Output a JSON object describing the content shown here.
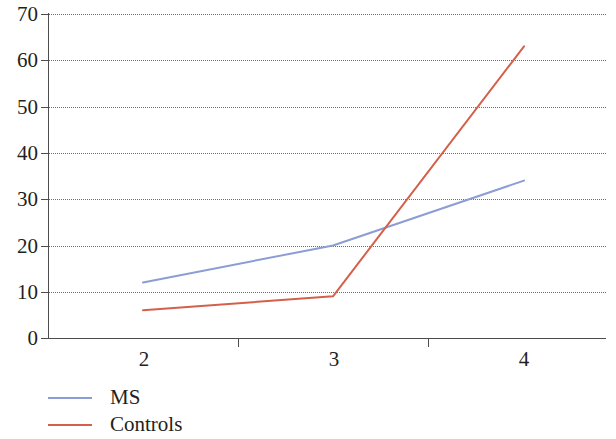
{
  "chart_data": {
    "type": "line",
    "title": "",
    "subtitle": "",
    "xlabel": "",
    "ylabel": "",
    "x": [
      2,
      3,
      4
    ],
    "x_tick_labels": [
      "2",
      "3",
      "4"
    ],
    "y_tick_labels": [
      "0",
      "10",
      "20",
      "30",
      "40",
      "50",
      "60",
      "70"
    ],
    "y_ticks": [
      0,
      10,
      20,
      30,
      40,
      50,
      60,
      70
    ],
    "xlim": [
      1.5,
      4.5
    ],
    "ylim": [
      0,
      70
    ],
    "grid": "horizontal-dotted",
    "legend_position": "bottom-left",
    "series": [
      {
        "name": "MS",
        "color": "#8b9dd4",
        "values": [
          12,
          20,
          34
        ]
      },
      {
        "name": "Controls",
        "color": "#d4604a",
        "values": [
          6,
          9,
          63
        ]
      }
    ]
  },
  "legend": {
    "items": [
      {
        "label": "MS",
        "color": "#8b9dd4"
      },
      {
        "label": "Controls",
        "color": "#d4604a"
      }
    ]
  },
  "colors": {
    "axis": "#4d4d4d",
    "grid": "#555555",
    "text": "#231f20",
    "background": "#ffffff",
    "series_ms": "#8b9dd4",
    "series_controls": "#d4604a"
  }
}
